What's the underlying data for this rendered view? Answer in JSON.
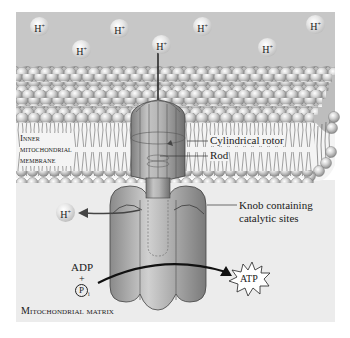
{
  "diagram": {
    "colors": {
      "intermembrane_space": "#c7c7c7",
      "matrix": "#ececec",
      "membrane_head": "#c9c9c9",
      "protein": "#a9a9a9",
      "arrow": "#111111"
    },
    "ions": [
      {
        "label": "H",
        "charge": "+",
        "x": 30,
        "y": 17
      },
      {
        "label": "H",
        "charge": "+",
        "x": 72,
        "y": 40
      },
      {
        "label": "H",
        "charge": "+",
        "x": 110,
        "y": 19
      },
      {
        "label": "H",
        "charge": "+",
        "x": 152,
        "y": 35
      },
      {
        "label": "H",
        "charge": "+",
        "x": 193,
        "y": 17
      },
      {
        "label": "H",
        "charge": "+",
        "x": 258,
        "y": 38
      },
      {
        "label": "H",
        "charge": "+",
        "x": 306,
        "y": 15
      },
      {
        "label": "H",
        "charge": "+",
        "x": 56,
        "y": 173
      }
    ],
    "labels": {
      "membrane_line1": "Inner",
      "membrane_line2": "mitochondrial",
      "membrane_line3": "membrane",
      "rotor": "Cylindrical rotor",
      "rod": "Rod",
      "knob_line1": "Knob containing",
      "knob_line2": "catalytic sites",
      "adp": "ADP",
      "plus": "+",
      "pi": "P",
      "pi_sub": "i",
      "atp": "ATP",
      "matrix": "Mitochondrial matrix"
    }
  }
}
